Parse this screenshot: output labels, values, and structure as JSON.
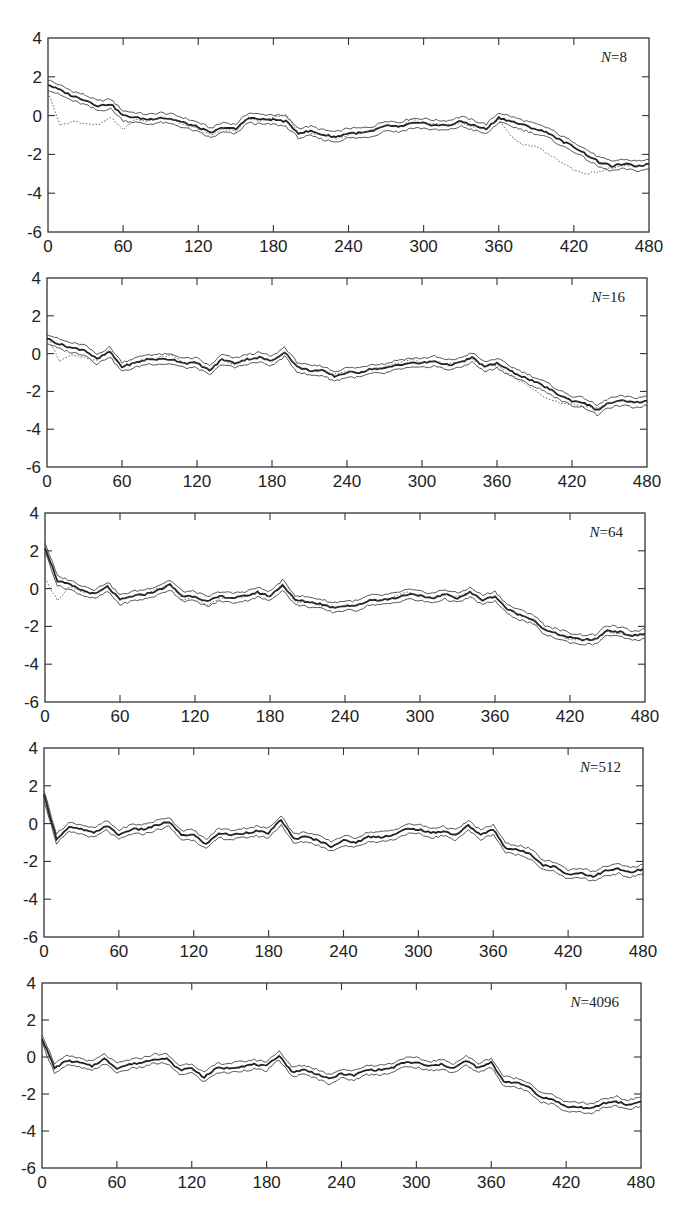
{
  "figure": {
    "layout": "5 vertically stacked panels",
    "line_color": "#222222",
    "bound_color": "#444444",
    "true_color": "#555555"
  },
  "chart_data": [
    {
      "type": "line",
      "label": "N=8",
      "label_italic_part": "N",
      "label_value": "=8",
      "frame": {
        "left": 48,
        "top": 38,
        "right": 649,
        "bottom": 232
      },
      "xlim": [
        0,
        480
      ],
      "ylim": [
        -6,
        4
      ],
      "xticks": [
        0,
        60,
        120,
        180,
        240,
        300,
        360,
        420,
        480
      ],
      "yticks": [
        4,
        2,
        0,
        -2,
        -4,
        -6
      ],
      "x": [
        0,
        10,
        20,
        30,
        40,
        50,
        60,
        70,
        80,
        90,
        100,
        110,
        120,
        130,
        140,
        150,
        160,
        170,
        180,
        190,
        200,
        210,
        220,
        230,
        240,
        250,
        260,
        270,
        280,
        290,
        300,
        310,
        320,
        330,
        340,
        350,
        360,
        370,
        380,
        390,
        400,
        410,
        420,
        430,
        440,
        450,
        460,
        470,
        480
      ],
      "series": [
        {
          "name": "estimate",
          "style": "thick",
          "values": [
            1.6,
            1.3,
            1.0,
            0.8,
            0.5,
            0.6,
            0.0,
            -0.1,
            -0.2,
            -0.1,
            -0.2,
            -0.4,
            -0.6,
            -0.9,
            -0.6,
            -0.7,
            -0.1,
            -0.2,
            -0.2,
            -0.3,
            -0.9,
            -0.8,
            -1.0,
            -1.1,
            -0.9,
            -0.9,
            -0.8,
            -0.5,
            -0.6,
            -0.4,
            -0.4,
            -0.5,
            -0.5,
            -0.3,
            -0.5,
            -0.7,
            -0.1,
            -0.3,
            -0.5,
            -0.7,
            -0.9,
            -1.3,
            -1.6,
            -2.0,
            -2.4,
            -2.6,
            -2.5,
            -2.6,
            -2.5
          ]
        },
        {
          "name": "true_state",
          "style": "dotted",
          "values": [
            1.2,
            -0.5,
            -0.3,
            -0.4,
            -0.5,
            -0.1,
            -0.7,
            -0.2,
            -0.3,
            -0.1,
            -0.2,
            -0.5,
            -0.7,
            -1.0,
            -0.7,
            -0.8,
            -0.1,
            -0.3,
            -0.1,
            0.1,
            -0.9,
            -0.9,
            -1.0,
            -1.2,
            -1.0,
            -0.9,
            -0.7,
            -0.5,
            -0.6,
            -0.2,
            -0.4,
            -0.4,
            -0.5,
            -0.4,
            -0.6,
            -0.7,
            -0.2,
            -1.1,
            -1.5,
            -1.6,
            -2.0,
            -2.4,
            -2.8,
            -3.0,
            -2.9,
            -2.7,
            -2.6,
            -2.6,
            -2.5
          ]
        }
      ],
      "band_halfwidth": 0.25
    },
    {
      "type": "line",
      "label": "N=16",
      "label_italic_part": "N",
      "label_value": "=16",
      "frame": {
        "left": 47,
        "top": 278,
        "right": 647,
        "bottom": 467
      },
      "xlim": [
        0,
        480
      ],
      "ylim": [
        -6,
        4
      ],
      "xticks": [
        0,
        60,
        120,
        180,
        240,
        300,
        360,
        420,
        480
      ],
      "yticks": [
        4,
        2,
        0,
        -2,
        -4,
        -6
      ],
      "x": [
        0,
        10,
        20,
        30,
        40,
        50,
        60,
        70,
        80,
        90,
        100,
        110,
        120,
        130,
        140,
        150,
        160,
        170,
        180,
        190,
        200,
        210,
        220,
        230,
        240,
        250,
        260,
        270,
        280,
        290,
        300,
        310,
        320,
        330,
        340,
        350,
        360,
        370,
        380,
        390,
        400,
        410,
        420,
        430,
        440,
        450,
        460,
        470,
        480
      ],
      "series": [
        {
          "name": "estimate",
          "style": "thick",
          "values": [
            0.8,
            0.5,
            0.3,
            0.2,
            -0.3,
            0.1,
            -0.7,
            -0.5,
            -0.3,
            -0.3,
            -0.3,
            -0.5,
            -0.5,
            -0.9,
            -0.3,
            -0.5,
            -0.3,
            -0.2,
            -0.4,
            0.1,
            -0.7,
            -0.9,
            -0.9,
            -1.2,
            -1.0,
            -1.0,
            -0.8,
            -0.8,
            -0.6,
            -0.5,
            -0.5,
            -0.4,
            -0.6,
            -0.5,
            -0.2,
            -0.7,
            -0.5,
            -0.9,
            -1.2,
            -1.5,
            -1.8,
            -2.2,
            -2.5,
            -2.6,
            -3.0,
            -2.6,
            -2.5,
            -2.6,
            -2.5
          ]
        },
        {
          "name": "true_state",
          "style": "dotted",
          "values": [
            1.0,
            -0.4,
            -0.1,
            -0.2,
            -0.4,
            0.2,
            -0.7,
            -0.5,
            -0.3,
            -0.2,
            -0.1,
            -0.5,
            -0.5,
            -0.9,
            -0.3,
            -0.6,
            -0.3,
            -0.2,
            -0.4,
            0.1,
            -0.7,
            -0.9,
            -0.9,
            -1.1,
            -0.9,
            -1.0,
            -0.8,
            -0.7,
            -0.5,
            -0.3,
            -0.5,
            -0.4,
            -0.6,
            -0.4,
            -0.3,
            -0.7,
            -0.6,
            -1.1,
            -1.5,
            -1.9,
            -2.4,
            -2.6,
            -2.7,
            -2.8,
            -2.9,
            -2.6,
            -2.5,
            -2.6,
            -2.5
          ]
        }
      ],
      "band_halfwidth": 0.25
    },
    {
      "type": "line",
      "label": "N=64",
      "label_italic_part": "N",
      "label_value": "=64",
      "frame": {
        "left": 45,
        "top": 513,
        "right": 645,
        "bottom": 702
      },
      "xlim": [
        0,
        480
      ],
      "ylim": [
        -6,
        4
      ],
      "xticks": [
        0,
        60,
        120,
        180,
        240,
        300,
        360,
        420,
        480
      ],
      "yticks": [
        4,
        2,
        0,
        -2,
        -4,
        -6
      ],
      "x": [
        0,
        10,
        20,
        30,
        40,
        50,
        60,
        70,
        80,
        90,
        100,
        110,
        120,
        130,
        140,
        150,
        160,
        170,
        180,
        190,
        200,
        210,
        220,
        230,
        240,
        250,
        260,
        270,
        280,
        290,
        300,
        310,
        320,
        330,
        340,
        350,
        360,
        370,
        380,
        390,
        400,
        410,
        420,
        430,
        440,
        450,
        460,
        470,
        480
      ],
      "series": [
        {
          "name": "estimate",
          "style": "thick",
          "values": [
            2.2,
            0.4,
            0.2,
            -0.1,
            -0.3,
            0.1,
            -0.6,
            -0.4,
            -0.3,
            -0.1,
            0.2,
            -0.4,
            -0.4,
            -0.7,
            -0.4,
            -0.5,
            -0.4,
            -0.2,
            -0.4,
            0.2,
            -0.6,
            -0.7,
            -0.8,
            -1.0,
            -0.9,
            -0.9,
            -0.6,
            -0.6,
            -0.5,
            -0.3,
            -0.4,
            -0.5,
            -0.3,
            -0.5,
            -0.2,
            -0.6,
            -0.4,
            -1.1,
            -1.4,
            -1.6,
            -2.2,
            -2.4,
            -2.6,
            -2.7,
            -2.7,
            -2.2,
            -2.3,
            -2.5,
            -2.4
          ]
        },
        {
          "name": "true_state",
          "style": "dotted",
          "values": [
            0.5,
            -0.6,
            0.1,
            -0.2,
            -0.3,
            0.1,
            -0.6,
            -0.4,
            -0.3,
            0.0,
            0.2,
            -0.6,
            -0.4,
            -0.9,
            -0.5,
            -0.5,
            -0.4,
            -0.2,
            -0.4,
            0.2,
            -0.7,
            -0.7,
            -0.9,
            -1.0,
            -0.9,
            -0.9,
            -0.6,
            -0.6,
            -0.4,
            -0.2,
            -0.4,
            -0.5,
            -0.3,
            -0.4,
            -0.2,
            -0.6,
            -0.4,
            -1.1,
            -1.4,
            -1.7,
            -2.2,
            -2.4,
            -2.7,
            -2.7,
            -2.7,
            -2.3,
            -2.4,
            -2.5,
            -2.4
          ]
        }
      ],
      "band_halfwidth": 0.25
    },
    {
      "type": "line",
      "label": "N=512",
      "label_italic_part": "N",
      "label_value": "=512",
      "frame": {
        "left": 44,
        "top": 748,
        "right": 643,
        "bottom": 937
      },
      "xlim": [
        0,
        480
      ],
      "ylim": [
        -6,
        4
      ],
      "xticks": [
        0,
        60,
        120,
        180,
        240,
        300,
        360,
        420,
        480
      ],
      "yticks": [
        4,
        2,
        0,
        -2,
        -4,
        -6
      ],
      "x": [
        0,
        10,
        20,
        30,
        40,
        50,
        60,
        70,
        80,
        90,
        100,
        110,
        120,
        130,
        140,
        150,
        160,
        170,
        180,
        190,
        200,
        210,
        220,
        230,
        240,
        250,
        260,
        270,
        280,
        290,
        300,
        310,
        320,
        330,
        340,
        350,
        360,
        370,
        380,
        390,
        400,
        410,
        420,
        430,
        440,
        450,
        460,
        470,
        480
      ],
      "series": [
        {
          "name": "estimate",
          "style": "thick",
          "values": [
            1.5,
            -0.8,
            -0.2,
            -0.3,
            -0.5,
            -0.1,
            -0.6,
            -0.3,
            -0.3,
            -0.1,
            0.1,
            -0.6,
            -0.6,
            -1.1,
            -0.5,
            -0.6,
            -0.5,
            -0.4,
            -0.5,
            0.2,
            -0.8,
            -0.7,
            -0.9,
            -1.2,
            -0.9,
            -1.0,
            -0.7,
            -0.7,
            -0.6,
            -0.3,
            -0.3,
            -0.5,
            -0.4,
            -0.6,
            -0.1,
            -0.6,
            -0.3,
            -1.3,
            -1.4,
            -1.6,
            -2.2,
            -2.3,
            -2.7,
            -2.6,
            -2.8,
            -2.5,
            -2.4,
            -2.6,
            -2.4
          ]
        }
      ],
      "band_halfwidth": 0.25
    },
    {
      "type": "line",
      "label": "N=4096",
      "label_italic_part": "N",
      "label_value": "=4096",
      "frame": {
        "left": 42,
        "top": 983,
        "right": 641,
        "bottom": 1168
      },
      "xlim": [
        0,
        480
      ],
      "ylim": [
        -6,
        4
      ],
      "xticks": [
        0,
        60,
        120,
        180,
        240,
        300,
        360,
        420,
        480
      ],
      "yticks": [
        4,
        2,
        0,
        -2,
        -4,
        -6
      ],
      "x": [
        0,
        10,
        20,
        30,
        40,
        50,
        60,
        70,
        80,
        90,
        100,
        110,
        120,
        130,
        140,
        150,
        160,
        170,
        180,
        190,
        200,
        210,
        220,
        230,
        240,
        250,
        260,
        270,
        280,
        290,
        300,
        310,
        320,
        330,
        340,
        350,
        360,
        370,
        380,
        390,
        400,
        410,
        420,
        430,
        440,
        450,
        460,
        470,
        480
      ],
      "series": [
        {
          "name": "estimate",
          "style": "thick",
          "values": [
            1.0,
            -0.6,
            -0.2,
            -0.3,
            -0.5,
            -0.1,
            -0.6,
            -0.4,
            -0.3,
            -0.1,
            -0.1,
            -0.7,
            -0.6,
            -1.1,
            -0.6,
            -0.6,
            -0.5,
            -0.4,
            -0.5,
            0.1,
            -0.8,
            -0.7,
            -0.9,
            -1.2,
            -0.9,
            -1.0,
            -0.7,
            -0.7,
            -0.6,
            -0.3,
            -0.3,
            -0.5,
            -0.4,
            -0.6,
            -0.2,
            -0.6,
            -0.3,
            -1.3,
            -1.4,
            -1.6,
            -2.2,
            -2.3,
            -2.7,
            -2.7,
            -2.8,
            -2.5,
            -2.4,
            -2.6,
            -2.4
          ]
        }
      ],
      "band_halfwidth": 0.25
    }
  ]
}
